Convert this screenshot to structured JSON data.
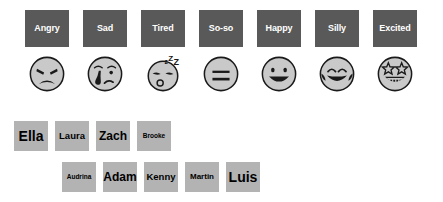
{
  "palette": {
    "background": "#ffffff",
    "mood_chip_bg": "#595959",
    "mood_chip_text": "#ffffff",
    "name_chip_bg": "#b3b3b3",
    "name_chip_text": "#000000",
    "face_fill": "#c9c9c9",
    "face_stroke": "#1a1a1a"
  },
  "moods": [
    {
      "label": "Angry",
      "icon": "angry-face-icon"
    },
    {
      "label": "Sad",
      "icon": "crying-face-icon"
    },
    {
      "label": "Tired",
      "icon": "sleepy-face-icon"
    },
    {
      "label": "So-so",
      "icon": "neutral-face-icon"
    },
    {
      "label": "Happy",
      "icon": "smiling-face-icon"
    },
    {
      "label": "Silly",
      "icon": "laughing-face-icon"
    },
    {
      "label": "Excited",
      "icon": "star-struck-face-icon"
    }
  ],
  "name_rows": [
    {
      "names": [
        {
          "label": "Ella",
          "size": "xl"
        },
        {
          "label": "Laura",
          "size": "md"
        },
        {
          "label": "Zach",
          "size": "lg"
        },
        {
          "label": "Brooke",
          "size": "xs"
        }
      ]
    },
    {
      "names": [
        {
          "label": "Audrina",
          "size": "xs"
        },
        {
          "label": "Adam",
          "size": "lg"
        },
        {
          "label": "Kenny",
          "size": "md"
        },
        {
          "label": "Martin",
          "size": "sm"
        },
        {
          "label": "Luis",
          "size": "xl"
        }
      ]
    }
  ]
}
